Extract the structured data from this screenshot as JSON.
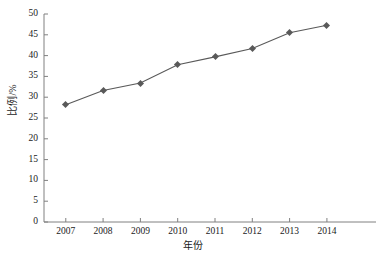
{
  "chart_data": {
    "type": "line",
    "title": "",
    "subtitle": "",
    "xlabel": "年份",
    "ylabel": "比例/%",
    "categories": [
      "2007",
      "2008",
      "2009",
      "2010",
      "2011",
      "2012",
      "2013",
      "2014"
    ],
    "x": [
      2007,
      2008,
      2009,
      2010,
      2011,
      2012,
      2013,
      2014
    ],
    "values": [
      28.2,
      31.6,
      33.4,
      37.8,
      39.7,
      41.7,
      45.5,
      47.3
    ],
    "series": [
      {
        "name": "比例/%",
        "values": [
          28.2,
          31.6,
          33.4,
          37.8,
          39.7,
          41.7,
          45.5,
          47.3
        ],
        "line_color": "#595959",
        "marker": "diamond",
        "marker_color": "#595959"
      }
    ],
    "xlim": [
      2006.5,
      2014.5
    ],
    "ylim": [
      0,
      50
    ],
    "yticks": [
      0,
      5,
      10,
      15,
      20,
      25,
      30,
      35,
      40,
      45,
      50
    ],
    "ytick_labels": [
      "0",
      "5",
      "10",
      "15",
      "20",
      "25",
      "30",
      "35",
      "40",
      "45",
      "50"
    ],
    "xtick_labels": [
      "2007",
      "2008",
      "2009",
      "2010",
      "2011",
      "2012",
      "2013",
      "2014"
    ],
    "grid": false,
    "legend": false,
    "legend_position": "none",
    "axis_color": "#808080",
    "text_color": "#1a1a1a",
    "background_color": "#ffffff"
  }
}
